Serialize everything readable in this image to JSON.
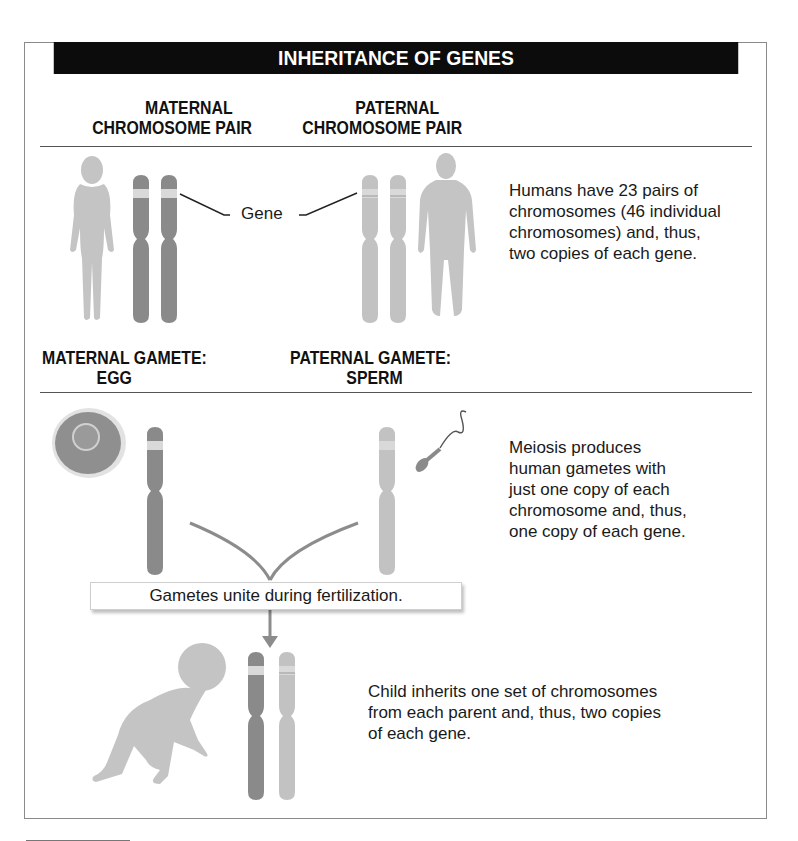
{
  "title": "INHERITANCE OF GENES",
  "section1": {
    "maternal_header": [
      "MATERNAL",
      "CHROMOSOME PAIR"
    ],
    "paternal_header": [
      "PATERNAL",
      "CHROMOSOME PAIR"
    ],
    "gene_label": "Gene",
    "description": [
      "Humans have 23 pairs of",
      "chromosomes (46 individual",
      "chromosomes) and, thus,",
      "two copies of each gene."
    ]
  },
  "section2": {
    "maternal_header": [
      "MATERNAL GAMETE:",
      "EGG"
    ],
    "paternal_header": [
      "PATERNAL GAMETE:",
      "SPERM"
    ],
    "description": [
      "Meiosis produces",
      "human gametes with",
      "just one copy of each",
      "chromosome and, thus,",
      "one copy of each gene."
    ],
    "callout": "Gametes unite during fertilization."
  },
  "section3": {
    "description": [
      "Child inherits one set of chromosomes",
      "from each parent and, thus, two copies",
      "of each gene."
    ]
  },
  "colors": {
    "maternal_chromosome": "#8a8a8a",
    "paternal_chromosome": "#c2c2c2",
    "gene_band": "#d9d9d9",
    "silhouette": "#c4c4c4",
    "arrow": "#8c8c8c",
    "title_bar": "#0c0c0c"
  }
}
